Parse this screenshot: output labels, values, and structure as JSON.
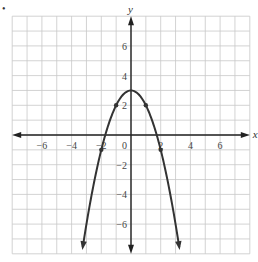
{
  "problem_marker": "•",
  "chart_data": {
    "type": "line",
    "title": "",
    "function": "y = 3 - x^2",
    "xlabel": "x",
    "ylabel": "y",
    "xlim": [
      -8,
      8
    ],
    "ylim": [
      -8,
      8
    ],
    "grid": true,
    "grid_step": 1,
    "x_ticks": [
      -6,
      -4,
      -2,
      2,
      4,
      6
    ],
    "y_ticks": [
      -6,
      -4,
      -2,
      2,
      4,
      6
    ],
    "origin_label": "0",
    "marked_points": [
      {
        "x": -2,
        "y": -1
      },
      {
        "x": -1,
        "y": 2
      },
      {
        "x": 0,
        "y": 3
      },
      {
        "x": 1,
        "y": 2
      },
      {
        "x": 2,
        "y": -1
      }
    ],
    "series": [
      {
        "name": "parabola",
        "x": [
          -3.2,
          -3,
          -2,
          -1,
          0,
          1,
          2,
          3,
          3.2
        ],
        "y": [
          -7.24,
          -6,
          -1,
          2,
          3,
          2,
          -1,
          -6,
          -7.24
        ]
      }
    ],
    "colors": {
      "curve": "#333333",
      "axes": "#222222",
      "grid": "#c8c8c8"
    }
  }
}
